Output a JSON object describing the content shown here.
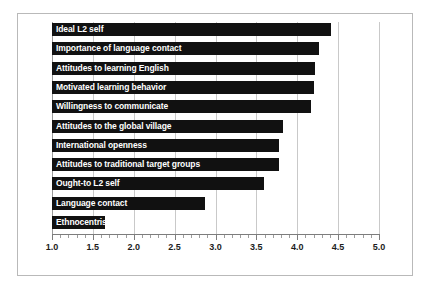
{
  "chart_data": {
    "type": "bar",
    "orientation": "horizontal",
    "title": "",
    "xlabel": "",
    "ylabel": "",
    "xlim": [
      1.0,
      5.0
    ],
    "xticks": [
      "1.0",
      "1.5",
      "2.0",
      "2.5",
      "3.0",
      "3.5",
      "4.0",
      "4.5",
      "5.0"
    ],
    "xtick_values": [
      1.0,
      1.5,
      2.0,
      2.5,
      3.0,
      3.5,
      4.0,
      4.5,
      5.0
    ],
    "minor_tick_step": 0.1,
    "grid": "vertical",
    "legend": "none",
    "bar_color": "#111111",
    "label_color": "#ffffff",
    "grid_color": "#c9c9c9",
    "categories": [
      "Ideal L2 self",
      "Importance of language contact",
      "Attitudes to learning English",
      "Motivated learning behavior",
      "Willingness to communicate",
      "Attitudes to the global village",
      "International openness",
      "Attitudes to traditional target groups",
      "Ought-to L2 self",
      "Language contact",
      "Ethnocentrism"
    ],
    "values": [
      4.41,
      4.26,
      4.22,
      4.2,
      4.17,
      3.83,
      3.78,
      3.78,
      3.59,
      2.87,
      1.65
    ]
  }
}
